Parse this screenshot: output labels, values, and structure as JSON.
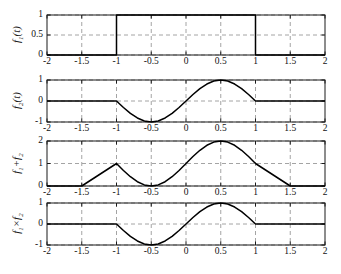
{
  "figure": {
    "background": "#ffffff",
    "axis_color": "#1a1a1a",
    "grid_color": "#9a9a9a",
    "curve_color": "#000000",
    "xlim": [
      -2,
      2
    ],
    "xticks": [
      "-2",
      "-1.5",
      "-1",
      "-0.5",
      "0",
      "0.5",
      "1",
      "1.5",
      "2"
    ],
    "xtick_values": [
      -2,
      -1.5,
      -1,
      -0.5,
      0,
      0.5,
      1,
      1.5,
      2
    ]
  },
  "chart_data": [
    {
      "type": "line",
      "title": "",
      "xlabel": "",
      "ylabel": "f1(t)",
      "ylabel_parts": {
        "base": "f",
        "sub": "1",
        "tail": "(t)"
      },
      "xlim": [
        -2,
        2
      ],
      "ylim": [
        0,
        1
      ],
      "yticks": [
        "0",
        "0.5",
        "1"
      ],
      "ytick_values": [
        0,
        0.5,
        1
      ],
      "grid": true,
      "description": "Rectangular pulse: 1 for -1<=t<=1, 0 elsewhere",
      "x": [
        -2,
        -1,
        -1,
        1,
        1,
        2
      ],
      "y": [
        0,
        0,
        1,
        1,
        0,
        0
      ]
    },
    {
      "type": "line",
      "title": "",
      "xlabel": "",
      "ylabel": "f2(t)",
      "ylabel_parts": {
        "base": "f",
        "sub": "2",
        "tail": "(t)"
      },
      "xlim": [
        -2,
        2
      ],
      "ylim": [
        -1,
        1
      ],
      "yticks": [
        "-1",
        "0",
        "1"
      ],
      "ytick_values": [
        -1,
        0,
        1
      ],
      "grid": true,
      "description": "sin(pi*t) for -1<=t<=1, 0 elsewhere",
      "x": [
        -2,
        -1.75,
        -1.5,
        -1.25,
        -1,
        -0.9,
        -0.8,
        -0.7,
        -0.6,
        -0.5,
        -0.4,
        -0.3,
        -0.2,
        -0.1,
        0,
        0.1,
        0.2,
        0.3,
        0.4,
        0.5,
        0.6,
        0.7,
        0.8,
        0.9,
        1,
        1.25,
        1.5,
        1.75,
        2
      ],
      "y": [
        0,
        0,
        0,
        0,
        0,
        -0.309,
        -0.588,
        -0.809,
        -0.951,
        -1,
        -0.951,
        -0.809,
        -0.588,
        -0.309,
        0,
        0.309,
        0.588,
        0.809,
        0.951,
        1,
        0.951,
        0.809,
        0.588,
        0.309,
        0,
        0,
        0,
        0,
        0
      ]
    },
    {
      "type": "line",
      "title": "",
      "xlabel": "",
      "ylabel": "f1+f2",
      "ylabel_parts": {
        "base": "f",
        "sub": "1",
        "tail": "+f",
        "sub2": "2"
      },
      "xlim": [
        -2,
        2
      ],
      "ylim": [
        0,
        2
      ],
      "yticks": [
        "0",
        "1",
        "2"
      ],
      "ytick_values": [
        0,
        1,
        2
      ],
      "grid": true,
      "description": "Sum: 1+sin(pi*t) for -1<=t<=1, 0 elsewhere",
      "x": [
        -2,
        -1.5,
        -1,
        -0.9,
        -0.8,
        -0.7,
        -0.6,
        -0.5,
        -0.4,
        -0.3,
        -0.2,
        -0.1,
        0,
        0.1,
        0.2,
        0.3,
        0.4,
        0.5,
        0.6,
        0.7,
        0.8,
        0.9,
        1,
        1.5,
        2
      ],
      "y": [
        0,
        0,
        1,
        0.691,
        0.412,
        0.191,
        0.049,
        0,
        0.049,
        0.191,
        0.412,
        0.691,
        1,
        1.309,
        1.588,
        1.809,
        1.951,
        2,
        1.951,
        1.809,
        1.588,
        1.309,
        1,
        0,
        0
      ]
    },
    {
      "type": "line",
      "title": "",
      "xlabel": "",
      "ylabel": "f1xf2",
      "ylabel_parts": {
        "base": "f",
        "sub": "1",
        "tail": "×f",
        "sub2": "2"
      },
      "xlim": [
        -2,
        2
      ],
      "ylim": [
        -1,
        1
      ],
      "yticks": [
        "-1",
        "0",
        "1"
      ],
      "ytick_values": [
        -1,
        0,
        1
      ],
      "grid": true,
      "description": "Product: sin(pi*t) for -1<=t<=1, 0 elsewhere",
      "x": [
        -2,
        -1.5,
        -1,
        -0.9,
        -0.8,
        -0.7,
        -0.6,
        -0.5,
        -0.4,
        -0.3,
        -0.2,
        -0.1,
        0,
        0.1,
        0.2,
        0.3,
        0.4,
        0.5,
        0.6,
        0.7,
        0.8,
        0.9,
        1,
        1.5,
        2
      ],
      "y": [
        0,
        0,
        0,
        -0.309,
        -0.588,
        -0.809,
        -0.951,
        -1,
        -0.951,
        -0.809,
        -0.588,
        -0.309,
        0,
        0.309,
        0.588,
        0.809,
        0.951,
        1,
        0.951,
        0.809,
        0.588,
        0.309,
        0,
        0,
        0
      ]
    }
  ]
}
